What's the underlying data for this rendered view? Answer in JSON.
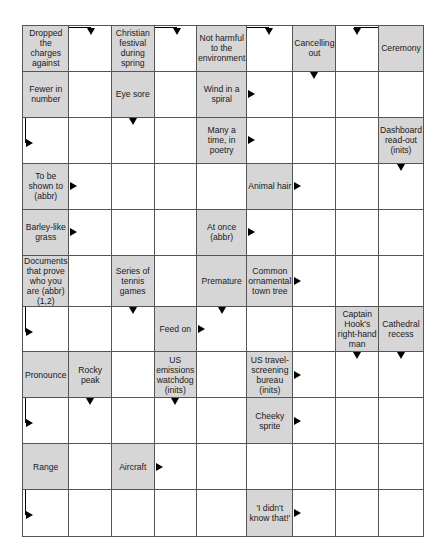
{
  "puzzle": {
    "type": "arrowword",
    "columns": 9,
    "rows": 11,
    "colors": {
      "clue_fill": "#d6d6d6",
      "answer_fill": "#ffffff",
      "grid_line": "#555555",
      "arrow": "#000000"
    },
    "grid": [
      [
        {
          "type": "clue",
          "text": "Dropped the charges against"
        },
        {
          "type": "answer",
          "arrow": "bent-right-down"
        },
        {
          "type": "clue",
          "text": "Christian festival during spring"
        },
        {
          "type": "answer",
          "arrow": "bent-right-down"
        },
        {
          "type": "clue",
          "text": "Not harmful to the environment"
        },
        {
          "type": "answer",
          "arrow": "bent-right-down"
        },
        {
          "type": "clue",
          "text": "Cancelling out",
          "arrow": "down"
        },
        {
          "type": "answer",
          "arrow": "bent-left-down"
        },
        {
          "type": "clue",
          "text": "Ceremony"
        }
      ],
      [
        {
          "type": "clue",
          "text": "Fewer in number"
        },
        {
          "type": "answer"
        },
        {
          "type": "clue",
          "text": "Eye sore",
          "arrow": "down"
        },
        {
          "type": "answer"
        },
        {
          "type": "clue",
          "text": "Wind in a spiral",
          "arrow": "right"
        },
        {
          "type": "answer"
        },
        {
          "type": "answer"
        },
        {
          "type": "answer"
        },
        {
          "type": "answer"
        }
      ],
      [
        {
          "type": "answer",
          "arrow": "bent-down-right"
        },
        {
          "type": "answer"
        },
        {
          "type": "answer"
        },
        {
          "type": "answer"
        },
        {
          "type": "clue",
          "text": "Many a time, in poetry",
          "arrow": "right"
        },
        {
          "type": "answer"
        },
        {
          "type": "answer"
        },
        {
          "type": "answer"
        },
        {
          "type": "clue",
          "text": "Dashboard read-out (inits)",
          "arrow": "down"
        }
      ],
      [
        {
          "type": "clue",
          "text": "To be shown to (abbr)",
          "arrow": "right"
        },
        {
          "type": "answer"
        },
        {
          "type": "answer"
        },
        {
          "type": "answer"
        },
        {
          "type": "answer"
        },
        {
          "type": "clue",
          "text": "Animal hair",
          "arrow": "right"
        },
        {
          "type": "answer"
        },
        {
          "type": "answer"
        },
        {
          "type": "answer"
        }
      ],
      [
        {
          "type": "clue",
          "text": "Barley-like grass",
          "arrow": "right"
        },
        {
          "type": "answer"
        },
        {
          "type": "answer"
        },
        {
          "type": "answer"
        },
        {
          "type": "clue",
          "text": "At once (abbr)",
          "arrow": "right"
        },
        {
          "type": "answer"
        },
        {
          "type": "answer"
        },
        {
          "type": "answer"
        },
        {
          "type": "answer"
        }
      ],
      [
        {
          "type": "clue",
          "text": "Documents that prove who you are (abbr) (1,2)"
        },
        {
          "type": "answer"
        },
        {
          "type": "clue",
          "text": "Series of tennis games",
          "arrow": "down"
        },
        {
          "type": "answer"
        },
        {
          "type": "clue",
          "text": "Premature",
          "arrow": "down"
        },
        {
          "type": "clue",
          "text": "Common ornamental town tree",
          "arrow": "right"
        },
        {
          "type": "answer"
        },
        {
          "type": "answer"
        },
        {
          "type": "answer"
        }
      ],
      [
        {
          "type": "answer",
          "arrow": "bent-down-right"
        },
        {
          "type": "answer"
        },
        {
          "type": "answer"
        },
        {
          "type": "clue",
          "text": "Feed on",
          "arrow": "right"
        },
        {
          "type": "answer"
        },
        {
          "type": "answer"
        },
        {
          "type": "answer"
        },
        {
          "type": "clue",
          "text": "Captain Hook's right-hand man",
          "arrow": "down"
        },
        {
          "type": "clue",
          "text": "Cathedral recess",
          "arrow": "down"
        }
      ],
      [
        {
          "type": "clue",
          "text": "Pronounce"
        },
        {
          "type": "clue",
          "text": "Rocky peak",
          "arrow": "down"
        },
        {
          "type": "answer"
        },
        {
          "type": "clue",
          "text": "US emissions watchdog (inits)",
          "arrow": "down"
        },
        {
          "type": "answer"
        },
        {
          "type": "clue",
          "text": "US travel-screening bureau (inits)",
          "arrow": "right"
        },
        {
          "type": "answer"
        },
        {
          "type": "answer"
        },
        {
          "type": "answer"
        }
      ],
      [
        {
          "type": "answer",
          "arrow": "bent-down-right"
        },
        {
          "type": "answer"
        },
        {
          "type": "answer"
        },
        {
          "type": "answer"
        },
        {
          "type": "answer"
        },
        {
          "type": "clue",
          "text": "Cheeky sprite",
          "arrow": "right"
        },
        {
          "type": "answer"
        },
        {
          "type": "answer"
        },
        {
          "type": "answer"
        }
      ],
      [
        {
          "type": "clue",
          "text": "Range"
        },
        {
          "type": "answer"
        },
        {
          "type": "clue",
          "text": "Aircraft",
          "arrow": "right"
        },
        {
          "type": "answer"
        },
        {
          "type": "answer"
        },
        {
          "type": "answer"
        },
        {
          "type": "answer"
        },
        {
          "type": "answer"
        },
        {
          "type": "answer"
        }
      ],
      [
        {
          "type": "answer",
          "arrow": "bent-down-right"
        },
        {
          "type": "answer"
        },
        {
          "type": "answer"
        },
        {
          "type": "answer"
        },
        {
          "type": "answer"
        },
        {
          "type": "clue",
          "text": "'I didn't know that!'",
          "arrow": "right"
        },
        {
          "type": "answer"
        },
        {
          "type": "answer"
        },
        {
          "type": "answer"
        }
      ]
    ]
  }
}
